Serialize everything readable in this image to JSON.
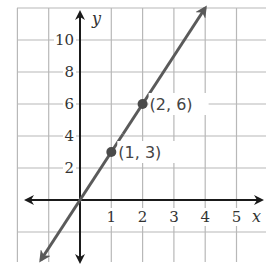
{
  "chart_data": {
    "type": "line",
    "title": "",
    "xlabel": "x",
    "ylabel": "y",
    "xlim": [
      -2,
      6
    ],
    "ylim": [
      -2,
      12
    ],
    "grid": true,
    "x_ticks": [
      1,
      2,
      3,
      4,
      5
    ],
    "y_ticks": [
      2,
      4,
      6,
      8,
      10
    ],
    "x_tick_labels": [
      "1",
      "2",
      "3",
      "4",
      "5"
    ],
    "y_tick_labels": [
      "2",
      "4",
      "6",
      "8",
      "10"
    ],
    "series": [
      {
        "name": "y = 3x",
        "equation": "y = 3x",
        "x": [
          -1.25,
          4
        ],
        "y": [
          -3.75,
          12
        ],
        "color": "#5a5a5a",
        "arrows": "both"
      }
    ],
    "points": [
      {
        "x": 1,
        "y": 3,
        "label": "(1, 3)"
      },
      {
        "x": 2,
        "y": 6,
        "label": "(2, 6)"
      }
    ],
    "colors": {
      "grid": "#b8b8b8",
      "axis": "#1a1a1a",
      "line": "#5a5a5a",
      "text": "#333333"
    }
  }
}
